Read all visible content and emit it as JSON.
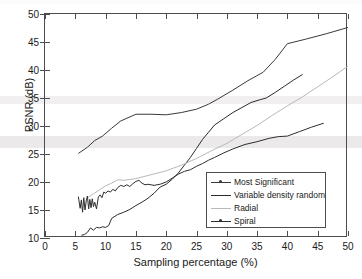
{
  "chart_data": {
    "type": "line",
    "title": "",
    "xlabel": "Sampling percentage (%)",
    "ylabel": "PSNR (dB)",
    "xlim": [
      0,
      50
    ],
    "ylim": [
      10,
      50
    ],
    "xticks": [
      0,
      5,
      10,
      15,
      20,
      25,
      30,
      35,
      40,
      45,
      50
    ],
    "yticks": [
      10,
      15,
      20,
      25,
      30,
      35,
      40,
      45,
      50
    ],
    "grid": false,
    "legend_position": "lower right inside",
    "series": [
      {
        "name": "Most Significant",
        "color": "#3a3a3a",
        "marker": "dot",
        "x": [
          5.5,
          7.0,
          8.2,
          9.5,
          11.0,
          12.5,
          15.0,
          17.5,
          20.0,
          22.5,
          25.0,
          27.0,
          28.5,
          31.0,
          33.5,
          36.0,
          38.0,
          40.0,
          43.0,
          46.5,
          50.0
        ],
        "y": [
          25.1,
          26.2,
          27.4,
          28.2,
          29.6,
          30.9,
          32.1,
          32.1,
          32.0,
          32.4,
          33.0,
          33.9,
          34.8,
          36.4,
          38.1,
          39.6,
          41.9,
          44.7,
          45.5,
          46.5,
          47.6
        ]
      },
      {
        "name": "Variable density random",
        "color": "#2b2b2b",
        "marker": "none",
        "x": [
          6.0,
          6.5,
          7.0,
          7.5,
          8.0,
          8.5,
          9.0,
          9.5,
          10.0,
          10.5,
          11.0,
          12.0,
          13.0,
          14.0,
          15.0,
          16.0,
          17.0,
          18.0,
          19.0,
          20.0,
          21.0,
          22.0,
          23.0,
          24.0,
          25.0,
          26.0,
          27.0,
          28.0,
          29.5,
          31.0,
          32.5,
          34.0,
          35.5,
          36.5,
          38.0,
          39.5,
          41.0,
          42.5
        ],
        "y": [
          10.5,
          10.6,
          11.0,
          11.8,
          11.4,
          11.9,
          11.8,
          12.0,
          11.9,
          12.2,
          13.5,
          14.2,
          14.6,
          15.1,
          15.8,
          16.4,
          17.1,
          18.0,
          19.1,
          19.6,
          20.5,
          21.6,
          23.0,
          24.4,
          26.0,
          27.6,
          28.9,
          30.2,
          31.3,
          32.4,
          33.3,
          34.2,
          34.7,
          35.0,
          36.0,
          37.1,
          38.2,
          39.2
        ]
      },
      {
        "name": "Radial",
        "color": "#b9b9b9",
        "marker": "none",
        "x": [
          7.0,
          8.0,
          9.0,
          10.0,
          11.0,
          12.0,
          13.0,
          15.0,
          17.5,
          20.0,
          22.5,
          25.0,
          27.5,
          30.0,
          32.5,
          35.0,
          37.5,
          40.0,
          42.5,
          45.0,
          47.5,
          50.0
        ],
        "y": [
          17.2,
          17.9,
          18.6,
          19.3,
          19.8,
          20.4,
          20.3,
          20.6,
          21.3,
          22.0,
          23.0,
          24.2,
          25.6,
          26.9,
          28.5,
          30.1,
          31.9,
          33.6,
          35.2,
          37.0,
          38.8,
          40.7
        ]
      },
      {
        "name": "Spiral",
        "color": "#2e2e2e",
        "marker": "dot",
        "x": [
          5.5,
          5.8,
          6.0,
          6.2,
          6.4,
          6.6,
          6.8,
          7.0,
          7.2,
          7.4,
          7.6,
          7.8,
          8.0,
          8.2,
          8.5,
          8.8,
          9.1,
          9.4,
          9.7,
          10.0,
          10.4,
          10.8,
          11.2,
          11.6,
          12.0,
          12.5,
          13.0,
          13.5,
          14.0,
          14.5,
          15.0,
          15.5,
          16.0,
          16.5,
          17.0,
          17.5,
          18.0,
          19.0,
          20.0,
          21.0,
          22.0,
          23.0,
          24.0,
          25.0,
          26.0,
          27.0,
          28.0,
          29.5,
          31.0,
          33.0,
          35.0,
          37.0,
          38.5,
          40.0,
          42.0,
          44.0,
          46.0
        ],
        "y": [
          17.4,
          15.3,
          16.8,
          14.6,
          17.2,
          15.0,
          16.6,
          17.5,
          15.2,
          16.9,
          15.4,
          17.0,
          15.6,
          16.4,
          15.2,
          17.3,
          17.7,
          17.2,
          18.2,
          18.0,
          18.4,
          18.2,
          18.7,
          18.4,
          19.0,
          19.4,
          19.2,
          19.5,
          19.2,
          19.7,
          20.1,
          20.3,
          19.8,
          19.5,
          19.6,
          19.5,
          19.4,
          19.6,
          20.0,
          20.7,
          21.4,
          21.9,
          22.2,
          22.8,
          23.3,
          23.9,
          24.4,
          25.2,
          25.9,
          26.7,
          27.2,
          27.8,
          28.1,
          28.2,
          29.0,
          29.8,
          30.5
        ]
      }
    ]
  },
  "legend": {
    "items": [
      {
        "label": "Most Significant"
      },
      {
        "label": "Variable density random"
      },
      {
        "label": "Radial"
      },
      {
        "label": "Spiral"
      }
    ]
  }
}
